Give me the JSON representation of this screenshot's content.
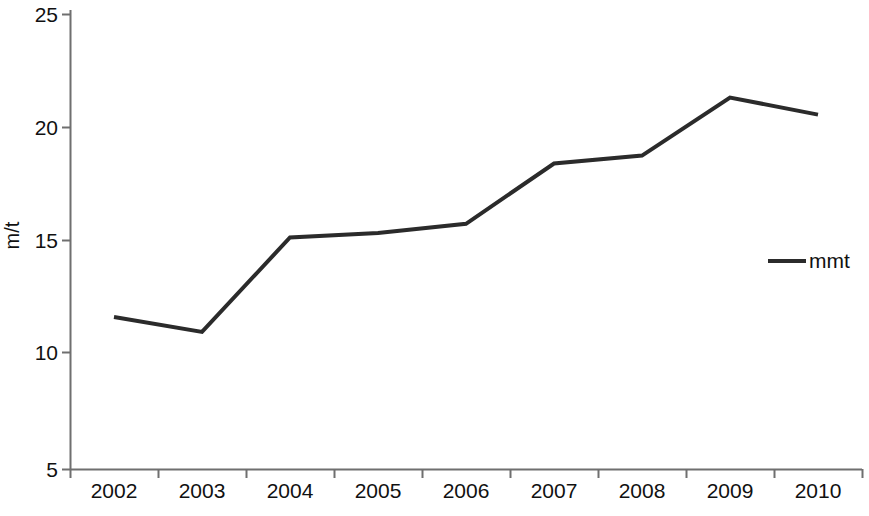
{
  "chart_data": {
    "type": "line",
    "title": "",
    "xlabel": "",
    "ylabel": "m/t",
    "categories": [
      "2002",
      "2003",
      "2004",
      "2005",
      "2006",
      "2007",
      "2008",
      "2009",
      "2010"
    ],
    "series": [
      {
        "name": "mmt",
        "values": [
          11.7,
          11.05,
          15.2,
          15.4,
          15.8,
          18.45,
          18.8,
          21.35,
          20.6
        ],
        "color": "#2b2b2b"
      }
    ],
    "ylim": [
      5,
      25
    ],
    "yticks": [
      5,
      10,
      15,
      20,
      25
    ],
    "ytick_labels": [
      "5",
      "10",
      "15",
      "20",
      "25"
    ],
    "grid": false,
    "legend_position": "right-middle",
    "legend_entries": [
      "mmt"
    ],
    "axis_color": "#6f6f6f",
    "background_color": "#ffffff"
  },
  "axes": {
    "y_title": "m/t",
    "y_labels": [
      "25",
      "20",
      "15",
      "10",
      "5"
    ],
    "x_labels": [
      "2002",
      "2003",
      "2004",
      "2005",
      "2006",
      "2007",
      "2008",
      "2009",
      "2010"
    ]
  },
  "legend": {
    "label": "mmt"
  }
}
